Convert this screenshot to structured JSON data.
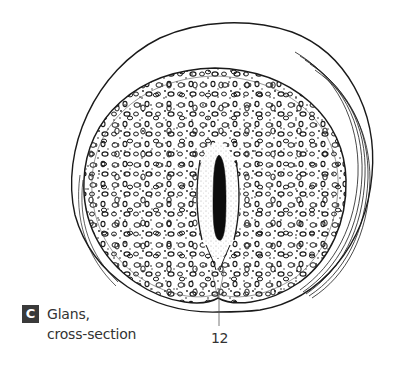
{
  "figure": {
    "panel_letter": "C",
    "caption_line1": "Glans,",
    "caption_line2": "cross-section",
    "callouts": [
      {
        "number": "12",
        "target": "urethral-slit-region"
      }
    ]
  },
  "colors": {
    "background": "#ffffff",
    "ink": "#1a1a1a",
    "badge_bg": "#3a3a3a",
    "badge_text": "#ffffff",
    "caption_text": "#333333"
  }
}
